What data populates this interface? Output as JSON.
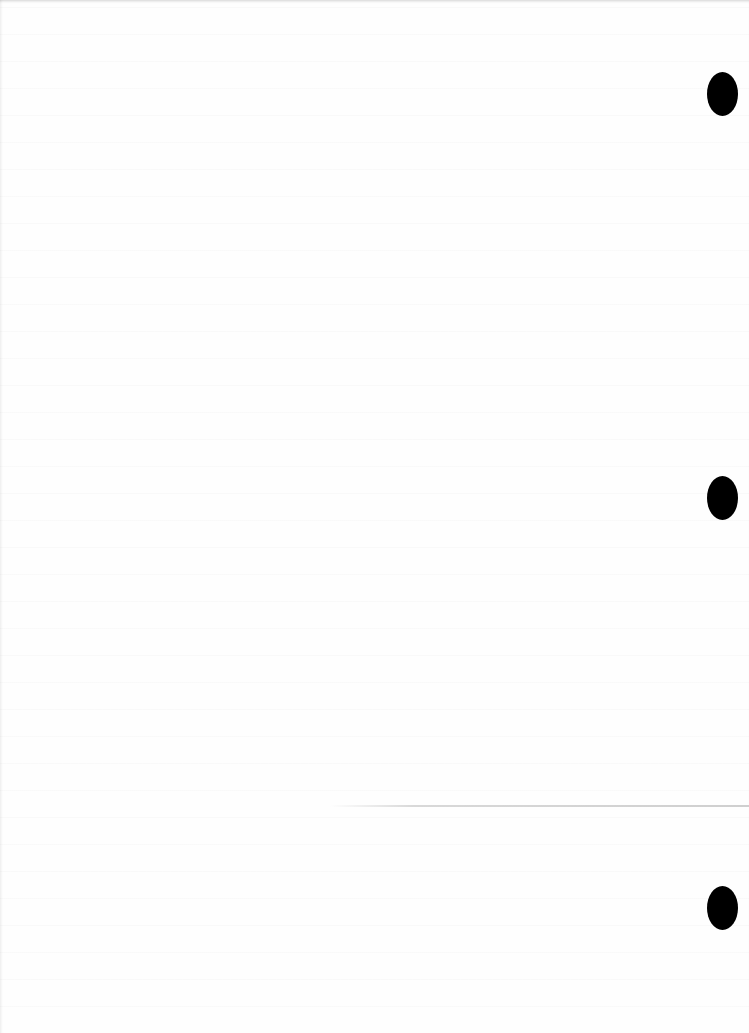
{
  "document": {
    "type": "blank scanned page",
    "text_content": "",
    "background_color": "#fefefe"
  },
  "punch_holes": [
    {
      "x": 722,
      "y": 94,
      "width": 31,
      "height": 44
    },
    {
      "x": 722,
      "y": 498,
      "width": 31,
      "height": 44
    },
    {
      "x": 722,
      "y": 908,
      "width": 31,
      "height": 44
    }
  ],
  "fold_line": {
    "y": 806,
    "color": "#cfcfcf"
  }
}
